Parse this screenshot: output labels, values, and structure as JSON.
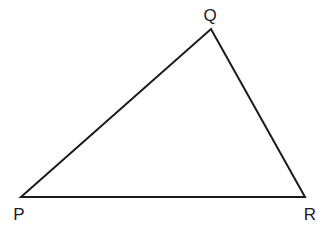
{
  "diagram": {
    "type": "triangle",
    "stroke_color": "#1a1a1a",
    "background": "#ffffff",
    "vertices": [
      {
        "label": "P",
        "x": 21,
        "y": 197,
        "label_x": 19,
        "label_y": 220
      },
      {
        "label": "Q",
        "x": 211,
        "y": 29,
        "label_x": 210,
        "label_y": 21
      },
      {
        "label": "R",
        "x": 305,
        "y": 197,
        "label_x": 310,
        "label_y": 220
      }
    ],
    "edges": [
      {
        "from": "P",
        "to": "Q"
      },
      {
        "from": "Q",
        "to": "R"
      },
      {
        "from": "R",
        "to": "P"
      }
    ]
  }
}
